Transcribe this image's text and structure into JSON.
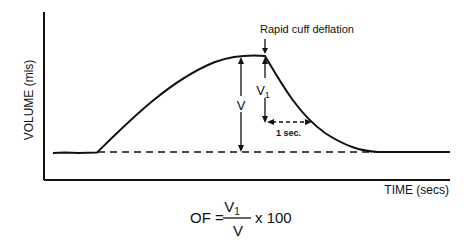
{
  "figure": {
    "type": "volume-time curve",
    "ylabel": "VOLUME (mls)",
    "xlabel": "TIME (secs)",
    "annotations": {
      "deflation": "Rapid cuff deflation",
      "v_label": "V",
      "v1_label": "V",
      "v1_sub": "1",
      "interval_label": "1 sec."
    },
    "formula": {
      "lhs": "OF =",
      "numerator": "V",
      "numerator_sub": "1",
      "denominator": "V",
      "multiplier": "x 100"
    },
    "colors": {
      "ink": "#111111",
      "background": "#ffffff"
    }
  }
}
